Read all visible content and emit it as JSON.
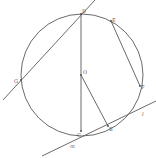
{
  "diagram": {
    "type": "circle-geometry",
    "circle": {
      "cx": 82,
      "cy": 75,
      "r": 61
    },
    "points": [
      {
        "id": "D",
        "label": "D",
        "x": 81,
        "y": 14,
        "lx": 82,
        "ly": 9
      },
      {
        "id": "E",
        "label": "E",
        "x": 111,
        "y": 21,
        "lx": 112,
        "ly": 18
      },
      {
        "id": "F",
        "label": "F",
        "x": 140,
        "y": 86,
        "lx": 141,
        "ly": 85
      },
      {
        "id": "G",
        "label": "G",
        "x": 21,
        "y": 80,
        "lx": 14,
        "ly": 79
      },
      {
        "id": "O",
        "label": "O",
        "x": 81,
        "y": 75,
        "lx": 83,
        "ly": 70
      },
      {
        "id": "C",
        "label": "C",
        "x": 81,
        "y": 131,
        "lx": 77,
        "ly": 133
      },
      {
        "id": "B",
        "label": "B",
        "x": 108,
        "y": 126,
        "lx": 109,
        "ly": 127
      }
    ],
    "segments": [
      {
        "name": "line-through-D-G",
        "x1": 3,
        "y1": 100,
        "x2": 95,
        "y2": 0
      },
      {
        "name": "segment-DC",
        "x1": 81,
        "y1": 14,
        "x2": 81,
        "y2": 131
      },
      {
        "name": "segment-OB",
        "x1": 81,
        "y1": 75,
        "x2": 108,
        "y2": 126
      },
      {
        "name": "segment-EF",
        "x1": 111,
        "y1": 21,
        "x2": 140,
        "y2": 86
      },
      {
        "name": "tangent-line",
        "x1": 42,
        "y1": 156,
        "x2": 156,
        "y2": 101
      }
    ],
    "line_labels": [
      {
        "label": "m",
        "x": 70,
        "y": 144
      },
      {
        "label": "l",
        "x": 142,
        "y": 112
      }
    ]
  }
}
